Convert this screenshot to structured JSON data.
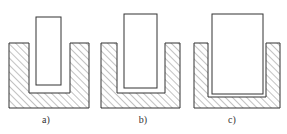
{
  "diagram": {
    "figures": [
      {
        "id": "a",
        "label": "a)",
        "outer": {
          "x": 9,
          "y": 43,
          "w": 80,
          "h": 65
        },
        "cavity": {
          "x": 29,
          "y": 43,
          "w": 41,
          "h": 50
        },
        "insert": {
          "x": 36,
          "y": 17,
          "w": 25,
          "h": 68
        },
        "label_x": 46
      },
      {
        "id": "b",
        "label": "b)",
        "outer": {
          "x": 101,
          "y": 43,
          "w": 79,
          "h": 65
        },
        "cavity": {
          "x": 117,
          "y": 43,
          "w": 48,
          "h": 50
        },
        "insert": {
          "x": 124,
          "y": 14,
          "w": 33,
          "h": 74
        },
        "label_x": 143
      },
      {
        "id": "c",
        "label": "c)",
        "outer": {
          "x": 194,
          "y": 43,
          "w": 86,
          "h": 65
        },
        "cavity": {
          "x": 208,
          "y": 43,
          "w": 58,
          "h": 54
        },
        "insert": {
          "x": 212,
          "y": 14,
          "w": 51,
          "h": 80
        },
        "label_x": 232
      }
    ],
    "colors": {
      "stroke": "#333333",
      "hatch": "#555555",
      "background": "#ffffff"
    }
  }
}
